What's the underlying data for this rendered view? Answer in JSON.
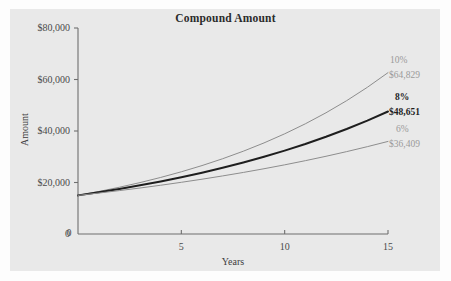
{
  "chart_data": {
    "type": "line",
    "title": "Compound Amount",
    "xlabel": "Years",
    "ylabel": "Amount",
    "xlim": [
      0,
      15
    ],
    "ylim": [
      0,
      80000
    ],
    "grid": false,
    "legend_position": "right-inline-annotations",
    "x_ticks": [
      "0",
      "5",
      "10",
      "15"
    ],
    "x_tick_values": [
      0,
      5,
      10,
      15
    ],
    "y_ticks": [
      "0",
      "$20,000",
      "$40,000",
      "$60,000",
      "$80,000"
    ],
    "y_tick_values": [
      0,
      20000,
      40000,
      60000,
      80000
    ],
    "principal": 15000,
    "series": [
      {
        "name": "10%",
        "rate": 0.1,
        "color": "#8d8d8d",
        "emphasis": false,
        "end_label": "$64,829",
        "end_value": 64829,
        "x": [
          0,
          1,
          2,
          3,
          4,
          5,
          6,
          7,
          8,
          9,
          10,
          11,
          12,
          13,
          14,
          15
        ],
        "values": [
          15000,
          16500,
          18150,
          19965,
          21962,
          24158,
          26573,
          29231,
          32154,
          35369,
          38906,
          42797,
          47077,
          51784,
          56963,
          62659
        ]
      },
      {
        "name": "8%",
        "rate": 0.08,
        "color": "#1e1e1e",
        "emphasis": true,
        "end_label": "$48,651",
        "end_value": 48651,
        "x": [
          0,
          1,
          2,
          3,
          4,
          5,
          6,
          7,
          8,
          9,
          10,
          11,
          12,
          13,
          14,
          15
        ],
        "values": [
          15000,
          16200,
          17496,
          18896,
          20404,
          22037,
          23800,
          25704,
          27760,
          29981,
          32379,
          34969,
          37767,
          40788,
          44051,
          47575
        ]
      },
      {
        "name": "6%",
        "rate": 0.06,
        "color": "#8d8d8d",
        "emphasis": false,
        "end_label": "$36,409",
        "end_value": 36409,
        "x": [
          0,
          1,
          2,
          3,
          4,
          5,
          6,
          7,
          8,
          9,
          10,
          11,
          12,
          13,
          14,
          15
        ],
        "values": [
          15000,
          15900,
          16854,
          17865,
          18937,
          20073,
          21278,
          22554,
          23908,
          25342,
          26863,
          28474,
          30183,
          31994,
          33914,
          35949
        ]
      }
    ]
  },
  "annotations": [
    {
      "id": "rate-10",
      "text": "10%",
      "style": "gray"
    },
    {
      "id": "amount-10",
      "text": "$64,829",
      "style": "gray"
    },
    {
      "id": "rate-8",
      "text": "8%",
      "style": "bold"
    },
    {
      "id": "amount-8",
      "text": "$48,651",
      "style": "bold"
    },
    {
      "id": "rate-6",
      "text": "6%",
      "style": "gray"
    },
    {
      "id": "amount-6",
      "text": "$36,409",
      "style": "gray"
    }
  ],
  "colors": {
    "panel_background": "#e9e9e9",
    "page_background": "#fdfdfd",
    "axis": "#6f6f6f",
    "emphasis_series": "#1e1e1e",
    "muted_series": "#8d8d8d",
    "tick_text": "#4a4a4a",
    "annotation_gray": "#9a9a9a"
  }
}
